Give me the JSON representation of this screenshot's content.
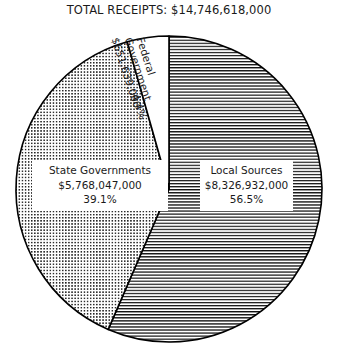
{
  "title": "TOTAL RECEIPTS: $14,746,618,000",
  "chart_data": {
    "type": "pie",
    "title": "TOTAL RECEIPTS: $14,746,618,000",
    "total_label": "TOTAL RECEIPTS",
    "total_value": "$14,746,618,000",
    "xlabel": "",
    "ylabel": "",
    "legend_position": "none",
    "grid": false,
    "start_angle_deg": 0,
    "direction": "clockwise",
    "categories": [
      "Local Sources",
      "State Governments",
      "Federal Government"
    ],
    "values": [
      8326932000,
      5768047000,
      651639000
    ],
    "percentages": [
      56.5,
      39.1,
      4.4
    ],
    "value_labels": [
      "$8,326,932,000",
      "$5,768,047,000",
      "$651,639,000"
    ],
    "percent_labels": [
      "56.5%",
      "39.1%",
      "4.4%"
    ],
    "fills": [
      "horizontal-lines",
      "dots",
      "white"
    ],
    "slices": [
      {
        "name": "Local Sources",
        "value": 8326932000,
        "value_label": "$8,326,932,000",
        "percent": 56.5,
        "percent_label": "56.5%",
        "fill": "horizontal-lines",
        "start_deg": 0,
        "end_deg": 203.4
      },
      {
        "name": "State Governments",
        "value": 5768047000,
        "value_label": "$5,768,047,000",
        "percent": 39.1,
        "percent_label": "39.1%",
        "fill": "dots",
        "start_deg": 203.4,
        "end_deg": 344.2
      },
      {
        "name": "Federal Government",
        "value": 651639000,
        "value_label": "$651,639,000",
        "percent": 4.4,
        "percent_label": "4.4%",
        "fill": "white",
        "start_deg": 344.2,
        "end_deg": 360
      }
    ]
  },
  "labels": {
    "state": {
      "name": "State Governments",
      "value": "$5,768,047,000",
      "percent": "39.1%"
    },
    "local": {
      "name": "Local Sources",
      "value": "$8,326,932,000",
      "percent": "56.5%"
    },
    "federal": {
      "name_line1": "Federal",
      "name_line2": "Government",
      "value": "$651,639,000",
      "percent": "4.4%"
    }
  },
  "colors": {
    "outline": "#000000",
    "background": "#ffffff",
    "text": "#1a1a1a",
    "hatch": "#000000"
  }
}
